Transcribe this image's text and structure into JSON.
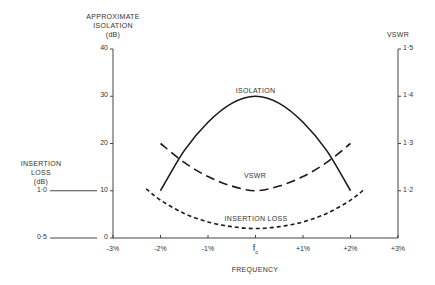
{
  "chart_data": {
    "type": "line",
    "title": "",
    "xlabel": "FREQUENCY",
    "x_ticks": [
      "-3%",
      "-2%",
      "-1%",
      "fc",
      "+1%",
      "+2%",
      "+3%"
    ],
    "x_range": [
      -3,
      3
    ],
    "x_unit": "% offset from fc",
    "axes": {
      "left_primary": {
        "label_lines": [
          "APPROXIMATE",
          "ISOLATION",
          "(dB)"
        ],
        "ticks": [
          "0",
          "10",
          "20",
          "30",
          "40"
        ],
        "range": [
          0,
          40
        ]
      },
      "left_secondary": {
        "label_lines": [
          "INSERTION",
          "LOSS",
          "(dB)"
        ],
        "ticks": [
          "0·5",
          "1·0"
        ],
        "tick_positions_on_primary": [
          0,
          10
        ]
      },
      "right": {
        "label": "VSWR",
        "ticks": [
          "1·2",
          "1·3",
          "1·4",
          "1·5"
        ],
        "range": [
          1.1,
          1.5
        ]
      }
    },
    "series": [
      {
        "name": "ISOLATION",
        "axis": "left_primary",
        "style": "solid",
        "x": [
          -2,
          -1.5,
          -1,
          -0.5,
          0,
          0.5,
          1,
          1.5,
          2
        ],
        "values": [
          10,
          18.5,
          24.5,
          28.5,
          30,
          28.5,
          24.5,
          18.5,
          10
        ]
      },
      {
        "name": "VSWR",
        "axis": "right",
        "style": "long-dash",
        "x": [
          -2,
          -1.5,
          -1,
          -0.5,
          0,
          0.5,
          1,
          1.5,
          2
        ],
        "values": [
          1.3,
          1.26,
          1.23,
          1.21,
          1.2,
          1.21,
          1.23,
          1.26,
          1.3
        ]
      },
      {
        "name": "INSERTION LOSS",
        "axis": "left_secondary",
        "style": "short-dash",
        "x": [
          -2.3,
          -2,
          -1.5,
          -1,
          -0.5,
          0,
          0.5,
          1,
          1.5,
          2,
          2.3
        ],
        "values": [
          1.02,
          0.9,
          0.76,
          0.67,
          0.62,
          0.6,
          0.62,
          0.67,
          0.76,
          0.9,
          1.02
        ]
      }
    ],
    "grid": false,
    "legend": "inline labels on curves"
  },
  "labels": {
    "isolation_axis": [
      "APPROXIMATE",
      "ISOLATION",
      "(dB)"
    ],
    "insertion_axis": [
      "INSERTION",
      "LOSS",
      "(dB)"
    ],
    "vswr_axis": "VSWR",
    "xlabel": "FREQUENCY",
    "curve_isolation": "ISOLATION",
    "curve_vswr": "VSWR",
    "curve_insertion": "INSERTION LOSS",
    "fc_main": "f",
    "fc_sub": "c"
  },
  "colors": {
    "line": "#1a1a1a",
    "axis": "#444444",
    "text": "#333333"
  }
}
